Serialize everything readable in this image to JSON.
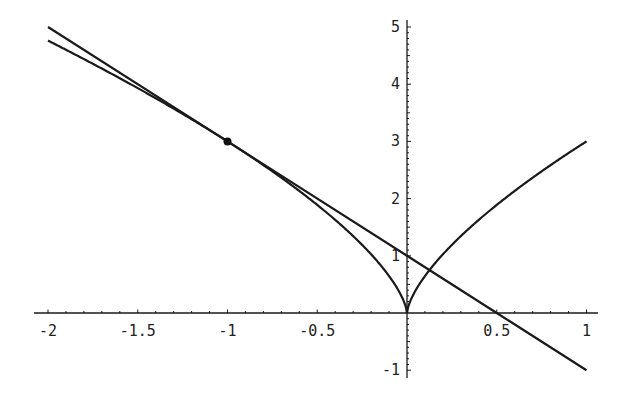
{
  "chart_data": {
    "type": "line",
    "title": "",
    "xlabel": "",
    "ylabel": "",
    "xlim": [
      -2,
      1
    ],
    "ylim": [
      -1,
      5
    ],
    "grid": false,
    "legend": null,
    "x_ticks": [
      -2,
      -1.5,
      -1,
      -0.5,
      0.5,
      1
    ],
    "x_tick_labels": [
      "-2",
      "-1.5",
      "-1",
      "-0.5",
      "0.5",
      "1"
    ],
    "y_ticks": [
      -1,
      1,
      2,
      3,
      4,
      5
    ],
    "y_tick_labels": [
      "-1",
      "1",
      "2",
      "3",
      "4",
      "5"
    ],
    "series": [
      {
        "name": "curve",
        "description": "y = 3|x|^(2/3)",
        "x": [
          -2,
          -1.5,
          -1,
          -0.5,
          -0.25,
          -0.1,
          0,
          0.1,
          0.25,
          0.5,
          0.75,
          1
        ],
        "values": [
          4.76,
          3.93,
          3.0,
          1.89,
          1.19,
          0.65,
          0,
          0.65,
          1.19,
          1.89,
          2.48,
          3.0
        ]
      },
      {
        "name": "tangent-line",
        "description": "y = -2x + 1 (tangent at x = -1)",
        "x": [
          -2,
          -1,
          0,
          0.5,
          1
        ],
        "values": [
          5,
          3,
          1,
          0,
          -1
        ]
      }
    ],
    "annotations": [
      {
        "type": "point",
        "x": -1,
        "y": 3,
        "label": ""
      }
    ]
  },
  "axes": {
    "x_labels": [
      "-2",
      "-1.5",
      "-1",
      "-0.5",
      "0.5",
      "1"
    ],
    "y_labels": [
      "-1",
      "1",
      "2",
      "3",
      "4",
      "5"
    ]
  }
}
